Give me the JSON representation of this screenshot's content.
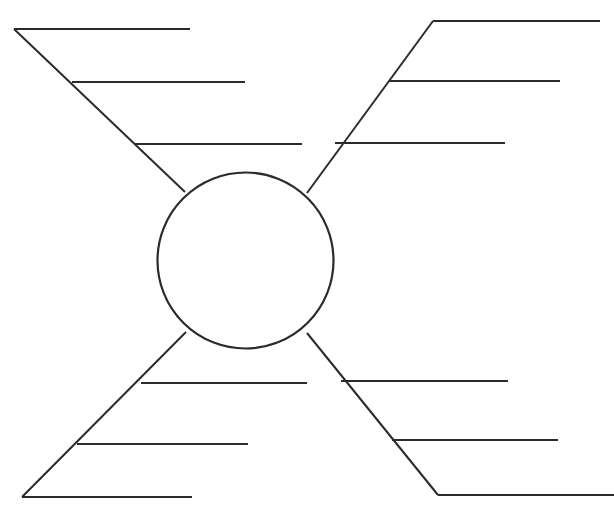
{
  "page": {
    "width": 614,
    "height": 508,
    "background_color": "#ffffff",
    "ink_color": "#2b2b2b",
    "top_artifact_text": ""
  },
  "center": {
    "label": "",
    "shape": "circle",
    "cx": 245.5,
    "cy": 260.5,
    "r": 88,
    "note": "empty topic circle"
  },
  "branches": [
    {
      "id": "top-left",
      "name": "branch-top-left",
      "label": "",
      "stem": {
        "x1": 14,
        "y1": 29,
        "x2": 185,
        "y2": 192
      },
      "lines": [
        {
          "id": "tl-1",
          "label": "",
          "x1": 14,
          "y1": 29,
          "x2": 190,
          "y2": 29
        },
        {
          "id": "tl-2",
          "label": "",
          "x1": 72,
          "y1": 82,
          "x2": 245,
          "y2": 82
        },
        {
          "id": "tl-3",
          "label": "",
          "x1": 135,
          "y1": 144,
          "x2": 302,
          "y2": 144
        }
      ]
    },
    {
      "id": "top-right",
      "name": "branch-top-right",
      "label": "",
      "stem": {
        "x1": 433,
        "y1": 21,
        "x2": 307,
        "y2": 193
      },
      "lines": [
        {
          "id": "tr-1",
          "label": "",
          "x1": 433,
          "y1": 21,
          "x2": 600,
          "y2": 21
        },
        {
          "id": "tr-2",
          "label": "",
          "x1": 389,
          "y1": 81,
          "x2": 560,
          "y2": 81
        },
        {
          "id": "tr-3",
          "label": "",
          "x1": 335,
          "y1": 143,
          "x2": 505,
          "y2": 143
        }
      ]
    },
    {
      "id": "bottom-left",
      "name": "branch-bottom-left",
      "label": "",
      "stem": {
        "x1": 22,
        "y1": 497,
        "x2": 186,
        "y2": 332
      },
      "lines": [
        {
          "id": "bl-1",
          "label": "",
          "x1": 141,
          "y1": 383,
          "x2": 307,
          "y2": 383
        },
        {
          "id": "bl-2",
          "label": "",
          "x1": 77,
          "y1": 444,
          "x2": 248,
          "y2": 444
        },
        {
          "id": "bl-3",
          "label": "",
          "x1": 22,
          "y1": 497,
          "x2": 192,
          "y2": 497
        }
      ]
    },
    {
      "id": "bottom-right",
      "name": "branch-bottom-right",
      "label": "",
      "stem": {
        "x1": 438,
        "y1": 495,
        "x2": 307,
        "y2": 333
      },
      "lines": [
        {
          "id": "br-1",
          "label": "",
          "x1": 341,
          "y1": 381,
          "x2": 508,
          "y2": 381
        },
        {
          "id": "br-2",
          "label": "",
          "x1": 392,
          "y1": 440,
          "x2": 558,
          "y2": 440
        },
        {
          "id": "br-3",
          "label": "",
          "x1": 438,
          "y1": 495,
          "x2": 614,
          "y2": 495
        }
      ]
    }
  ]
}
